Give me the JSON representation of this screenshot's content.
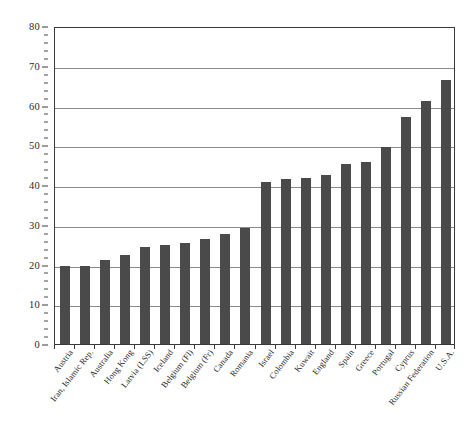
{
  "chart_data": {
    "type": "bar",
    "title": "",
    "subtitle": "",
    "xlabel": "",
    "ylabel": "",
    "ylim": [
      0,
      80
    ],
    "y_major_step": 10,
    "y_minor_step": 2,
    "grid": "horizontal",
    "legend": "none",
    "bar_color": "#4a4a4a",
    "categories": [
      "Austria",
      "Iran, Islamic Rep.",
      "Australia",
      "Hong Kong",
      "Latvia (LSS)",
      "Iceland",
      "Belgium (Fl)",
      "Belgium (Fr)",
      "Canada",
      "Romania",
      "Israel",
      "Colombia",
      "Kuwait",
      "England",
      "Spain",
      "Greece",
      "Portugal",
      "Cyprus",
      "Russian Federation",
      "U.S.A."
    ],
    "values": [
      19.7,
      19.7,
      21.2,
      22.3,
      24.4,
      24.8,
      25.5,
      26.3,
      27.7,
      29.2,
      40.7,
      41.4,
      41.7,
      42.4,
      45.3,
      45.8,
      49.5,
      57.0,
      61.2,
      66.5
    ],
    "y_tick_labels": [
      "0",
      "10",
      "20",
      "30",
      "40",
      "50",
      "60",
      "70",
      "80"
    ],
    "y_tick_values": [
      0,
      10,
      20,
      30,
      40,
      50,
      60,
      70,
      80
    ]
  }
}
